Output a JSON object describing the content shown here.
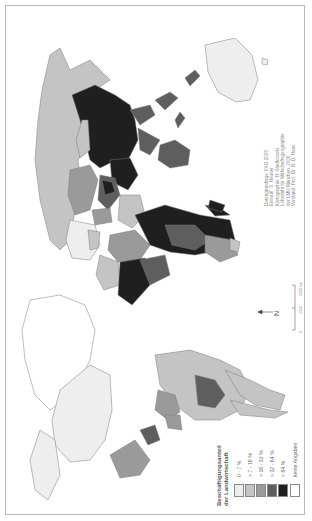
{
  "map": {
    "orientation": "rotated 90 degrees counter-clockwise",
    "theme": "Beschäftigungsanteil der Landwirtschaft",
    "legend": {
      "title_line1": "Beschäftigungsanteil",
      "title_line2": "der Landwirtschaft",
      "classes": [
        {
          "label": "0 - 7 %",
          "color": "#eeeeee"
        },
        {
          "label": "> 7 - 16 %",
          "color": "#c4c4c4"
        },
        {
          "label": "> 16 - 32 %",
          "color": "#9a9a9a"
        },
        {
          "label": "> 32 - 64 %",
          "color": "#5e5e5e"
        },
        {
          "label": "> 64 %",
          "color": "#1f1f1f"
        },
        {
          "label": "keine Angaben",
          "color": "#ffffff"
        }
      ]
    },
    "credits": [
      "Datengrundlage: FAO 2005",
      "Entwurf: S. Neuner",
      "Kartographie: H. Sladkowski",
      "Lehrstuhl für Wirtschaftsgeographie",
      "der LMU München, 2006",
      "Vorstand: Prof. Dr. H.-D. Haas"
    ],
    "scale_bar": {
      "ticks": [
        "0",
        "1250",
        "2500 km"
      ]
    },
    "north_arrow": {
      "label": "N"
    },
    "colors": {
      "frame": "#b8b8b8",
      "border_lines": "#ffffff",
      "coastline": "#7a7a7a"
    }
  }
}
